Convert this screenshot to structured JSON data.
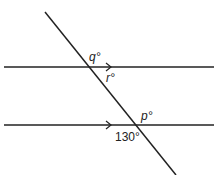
{
  "diagram": {
    "type": "parallel-lines-transversal",
    "labels": {
      "q": "q°",
      "r": "r°",
      "p": "p°",
      "given": "130°"
    },
    "colors": {
      "line": "#222222",
      "background": "#ffffff"
    }
  }
}
